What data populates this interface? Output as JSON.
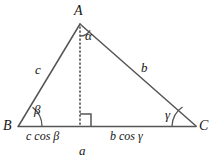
{
  "figure": {
    "type": "geometry-diagram",
    "background_color": "#ffffff",
    "stroke_color": "#555555",
    "text_color": "#151515"
  },
  "vertices": {
    "apex": {
      "label": "A",
      "x": 80,
      "y": 126
    },
    "left": {
      "label": "B",
      "x": 18,
      "y": 126
    },
    "right": {
      "label": "C",
      "x": 196,
      "y": 126
    }
  },
  "sides": {
    "left_side": {
      "label": "c"
    },
    "right_side": {
      "label": "b"
    },
    "base": {
      "label": "a"
    }
  },
  "angles": {
    "apex_angle": {
      "label": "α"
    },
    "left_angle": {
      "label": "β"
    },
    "right_angle": {
      "label": "γ"
    }
  },
  "segments": {
    "left_projection": {
      "factor": "c",
      "function": "cos",
      "angle": "β",
      "label": "c cos β"
    },
    "right_projection": {
      "factor": "b",
      "function": "cos",
      "angle": "γ",
      "label": "b cos γ"
    }
  },
  "altitude": {
    "style": "dotted",
    "right_angle_marker": true
  }
}
